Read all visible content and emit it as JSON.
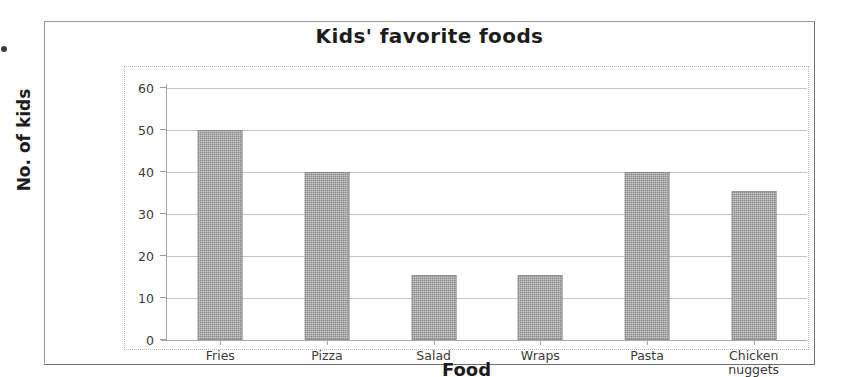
{
  "chart_data": {
    "type": "bar",
    "title": "Kids' favorite foods",
    "xlabel": "Food",
    "ylabel": "No. of kids",
    "categories": [
      "Fries",
      "Pizza",
      "Salad",
      "Wraps",
      "Pasta",
      "Chicken nuggets"
    ],
    "category_lines": [
      [
        "Fries"
      ],
      [
        "Pizza"
      ],
      [
        "Salad"
      ],
      [
        "Wraps"
      ],
      [
        "Pasta"
      ],
      [
        "Chicken",
        "nuggets"
      ]
    ],
    "values": [
      50,
      40,
      15.5,
      15.5,
      40,
      35.5
    ],
    "ylim": [
      0,
      60
    ],
    "ytick_values": [
      0,
      10,
      20,
      30,
      40,
      50,
      60
    ],
    "ytick_labels": [
      "0",
      "10",
      "20",
      "30",
      "40",
      "50",
      "60"
    ],
    "grid": true,
    "legend": false,
    "bar_color": "#8d8d8d",
    "gridline_color": "#c4c4c4",
    "axis_color": "#a6a6a6",
    "plot_border_color": "#b9b9b9",
    "frame_border_color": "#9a9a9a",
    "text_color": "#1d1d1d"
  }
}
